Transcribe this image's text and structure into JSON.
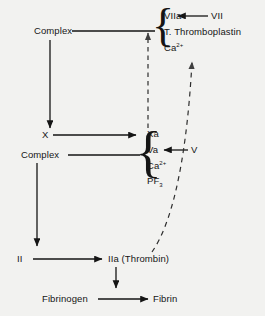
{
  "diagram": {
    "background_color": "#f2f2f0",
    "ink_color": "#151515",
    "nodes": {
      "complex_top": "Complex",
      "complex_mid": "Complex",
      "factor_x": "X",
      "factor_ii": "II",
      "factor_vii": "VII",
      "factor_v": "V",
      "viia": "VIIa",
      "tissue_thromboplastin": "T. Thromboplastin",
      "calcium_top": "Ca",
      "calcium_top_charge": "2+",
      "xa": "Xa",
      "va": "Va",
      "calcium_mid": "Ca",
      "calcium_mid_charge": "2+",
      "pf3": "PF",
      "pf3_sub": "3",
      "iia_thrombin": "IIa (Thrombin)",
      "fibrinogen": "Fibrinogen",
      "fibrin": "Fibrin"
    },
    "braces": {
      "top_brace": "{",
      "mid_brace": "{"
    },
    "arrows": [
      {
        "name": "complex-top-to-viia-cluster",
        "style": "solid",
        "direction": "right"
      },
      {
        "name": "vii-to-viia",
        "style": "solid",
        "direction": "left"
      },
      {
        "name": "complex-top-to-factor-x",
        "style": "solid",
        "direction": "down"
      },
      {
        "name": "factor-x-to-xa",
        "style": "solid",
        "direction": "right"
      },
      {
        "name": "complex-mid-to-xa-cluster",
        "style": "solid",
        "direction": "right"
      },
      {
        "name": "v-to-va",
        "style": "solid",
        "direction": "left"
      },
      {
        "name": "complex-mid-to-factor-ii",
        "style": "solid",
        "direction": "down"
      },
      {
        "name": "factor-ii-to-iia",
        "style": "solid",
        "direction": "right"
      },
      {
        "name": "iia-to-fibrin-arrow",
        "style": "solid",
        "direction": "down"
      },
      {
        "name": "fibrinogen-to-fibrin",
        "style": "solid",
        "direction": "right"
      },
      {
        "name": "xa-feedback-to-viia-cluster",
        "style": "dashed",
        "direction": "up"
      },
      {
        "name": "thrombin-feedback-to-calcium",
        "style": "dashed",
        "direction": "up-curved"
      }
    ]
  }
}
